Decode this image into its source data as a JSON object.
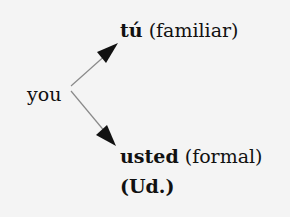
{
  "source": {
    "word": "you"
  },
  "targets": [
    {
      "term": "tú",
      "gloss": "(familiar)"
    },
    {
      "term": "usted",
      "gloss": "(formal)",
      "abbrev": "(Ud.)"
    }
  ],
  "colors": {
    "background": "#f4f4f4",
    "arrow_line": "#8a8a8a",
    "arrow_head": "#111111",
    "text": "#111111"
  }
}
